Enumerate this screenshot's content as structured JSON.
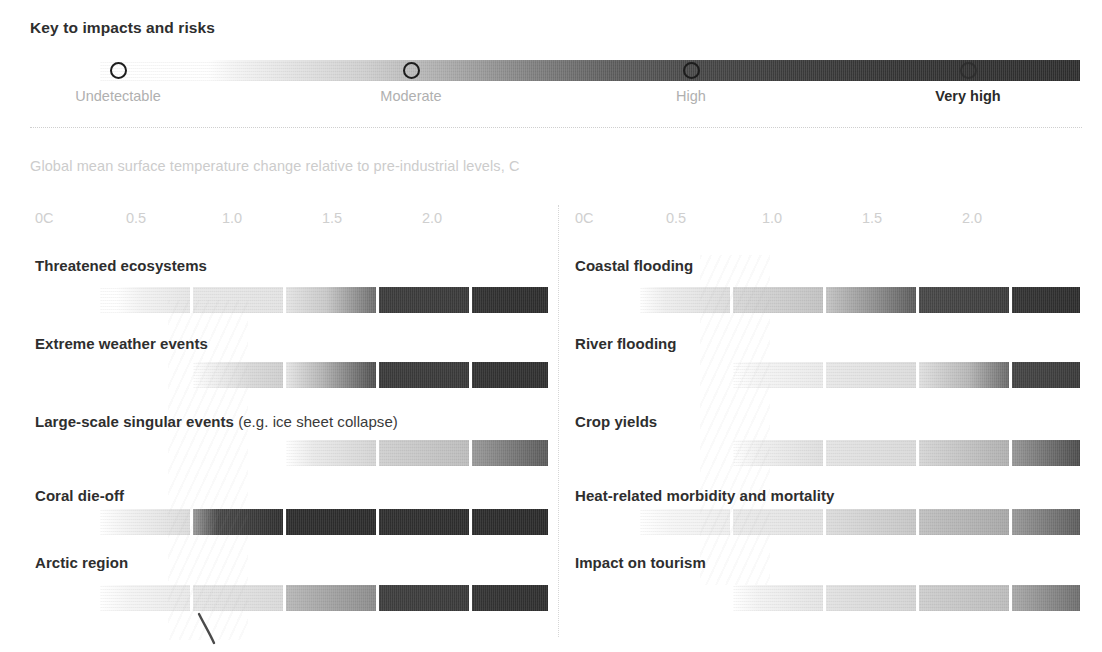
{
  "key": {
    "title": "Key to impacts and risks",
    "levels": [
      {
        "label": "Undetectable",
        "x": 118,
        "emphasis": false
      },
      {
        "label": "Moderate",
        "x": 411,
        "emphasis": false
      },
      {
        "label": "High",
        "x": 691,
        "emphasis": false
      },
      {
        "label": "Very high",
        "x": 968,
        "emphasis": true
      }
    ],
    "gradient_from": "#ffffff",
    "gradient_to": "#2e2e2e"
  },
  "axis": {
    "caption": "Global mean surface temperature change relative to pre-industrial levels, C",
    "ticks": [
      "0C",
      "0.5",
      "1.0",
      "1.5",
      "2.0"
    ],
    "tick_x_left": [
      35,
      126,
      222,
      322,
      422
    ],
    "tick_x_right": [
      575,
      666,
      762,
      862,
      962
    ]
  },
  "chart_data": {
    "type": "heatmap",
    "title": "Key to impacts and risks",
    "xlabel": "Global mean surface temperature change relative to pre-industrial levels, C",
    "ylabel": "",
    "xlim": [
      0,
      2.5
    ],
    "grid": false,
    "legend_position": "top",
    "legend_entries": [
      "Undetectable",
      "Moderate",
      "High",
      "Very high"
    ],
    "categories": [
      "Threatened ecosystems",
      "Extreme weather events",
      "Large-scale singular events (e.g. ice sheet collapse)",
      "Coral die-off",
      "Arctic region",
      "Coastal flooding",
      "River flooding",
      "Crop yields",
      "Heat-related morbidity and mortality",
      "Impact on tourism"
    ],
    "series": [
      {
        "name": "Threatened ecosystems",
        "column": "left",
        "risk_start_C": 0.35,
        "segments": [
          {
            "from": 0.3,
            "to": 0.5,
            "level_start": "undetectable",
            "level_end": "low"
          },
          {
            "from": 0.5,
            "to": 1.0,
            "level_start": "low",
            "level_end": "low"
          },
          {
            "from": 1.0,
            "to": 1.5,
            "level_start": "low",
            "level_end": "high"
          },
          {
            "from": 1.5,
            "to": 2.0,
            "level_start": "high",
            "level_end": "high"
          },
          {
            "from": 2.0,
            "to": 2.5,
            "level_start": "very high",
            "level_end": "very high"
          }
        ]
      },
      {
        "name": "Extreme weather events",
        "column": "left",
        "risk_start_C": 0.65,
        "segments": [
          {
            "from": 0.5,
            "to": 1.0,
            "level_start": "undetectable",
            "level_end": "low"
          },
          {
            "from": 1.0,
            "to": 1.5,
            "level_start": "low",
            "level_end": "high"
          },
          {
            "from": 1.5,
            "to": 2.0,
            "level_start": "high",
            "level_end": "high"
          },
          {
            "from": 2.0,
            "to": 2.5,
            "level_start": "very high",
            "level_end": "very high"
          }
        ]
      },
      {
        "name": "Large-scale singular events (e.g. ice sheet collapse)",
        "column": "left",
        "risk_start_C": 0.95,
        "segments": [
          {
            "from": 0.9,
            "to": 1.0,
            "level_start": "undetectable",
            "level_end": "low"
          },
          {
            "from": 1.0,
            "to": 1.5,
            "level_start": "low",
            "level_end": "low"
          },
          {
            "from": 1.5,
            "to": 2.0,
            "level_start": "low",
            "level_end": "moderate"
          },
          {
            "from": 2.0,
            "to": 2.5,
            "level_start": "moderate",
            "level_end": "high"
          }
        ]
      },
      {
        "name": "Coral die-off",
        "column": "left",
        "risk_start_C": 0.2,
        "segments": [
          {
            "from": 0.1,
            "to": 0.5,
            "level_start": "undetectable",
            "level_end": "low"
          },
          {
            "from": 0.5,
            "to": 1.0,
            "level_start": "moderate",
            "level_end": "very high"
          },
          {
            "from": 1.0,
            "to": 1.5,
            "level_start": "very high",
            "level_end": "very high"
          },
          {
            "from": 1.5,
            "to": 2.0,
            "level_start": "very high",
            "level_end": "very high"
          },
          {
            "from": 2.0,
            "to": 2.5,
            "level_start": "very high",
            "level_end": "very high"
          }
        ]
      },
      {
        "name": "Arctic region",
        "column": "left",
        "risk_start_C": 0.25,
        "segments": [
          {
            "from": 0.15,
            "to": 0.5,
            "level_start": "undetectable",
            "level_end": "low"
          },
          {
            "from": 0.5,
            "to": 1.0,
            "level_start": "low",
            "level_end": "low"
          },
          {
            "from": 1.0,
            "to": 1.5,
            "level_start": "moderate",
            "level_end": "moderate"
          },
          {
            "from": 1.5,
            "to": 2.0,
            "level_start": "high",
            "level_end": "high"
          },
          {
            "from": 2.0,
            "to": 2.5,
            "level_start": "very high",
            "level_end": "very high"
          }
        ]
      },
      {
        "name": "Coastal flooding",
        "column": "right",
        "risk_start_C": 0.15,
        "segments": [
          {
            "from": 0.1,
            "to": 0.5,
            "level_start": "undetectable",
            "level_end": "low"
          },
          {
            "from": 0.5,
            "to": 1.0,
            "level_start": "low",
            "level_end": "moderate"
          },
          {
            "from": 1.0,
            "to": 1.5,
            "level_start": "moderate",
            "level_end": "high"
          },
          {
            "from": 1.5,
            "to": 2.0,
            "level_start": "high",
            "level_end": "high"
          },
          {
            "from": 2.0,
            "to": 2.5,
            "level_start": "very high",
            "level_end": "very high"
          }
        ]
      },
      {
        "name": "River flooding",
        "column": "right",
        "risk_start_C": 0.6,
        "segments": [
          {
            "from": 0.5,
            "to": 1.0,
            "level_start": "undetectable",
            "level_end": "low"
          },
          {
            "from": 1.0,
            "to": 1.5,
            "level_start": "low",
            "level_end": "low"
          },
          {
            "from": 1.5,
            "to": 2.0,
            "level_start": "low",
            "level_end": "moderate"
          },
          {
            "from": 2.0,
            "to": 2.5,
            "level_start": "high",
            "level_end": "high"
          }
        ]
      },
      {
        "name": "Crop yields",
        "column": "right",
        "risk_start_C": 0.6,
        "segments": [
          {
            "from": 0.5,
            "to": 1.0,
            "level_start": "undetectable",
            "level_end": "low"
          },
          {
            "from": 1.0,
            "to": 1.5,
            "level_start": "low",
            "level_end": "low"
          },
          {
            "from": 1.5,
            "to": 2.0,
            "level_start": "low",
            "level_end": "moderate"
          },
          {
            "from": 2.0,
            "to": 2.5,
            "level_start": "moderate",
            "level_end": "high"
          }
        ]
      },
      {
        "name": "Heat-related morbidity and mortality",
        "column": "right",
        "risk_start_C": 0.2,
        "segments": [
          {
            "from": 0.1,
            "to": 0.5,
            "level_start": "undetectable",
            "level_end": "low"
          },
          {
            "from": 0.5,
            "to": 1.0,
            "level_start": "low",
            "level_end": "low"
          },
          {
            "from": 1.0,
            "to": 1.5,
            "level_start": "low",
            "level_end": "moderate"
          },
          {
            "from": 1.5,
            "to": 2.0,
            "level_start": "moderate",
            "level_end": "moderate"
          },
          {
            "from": 2.0,
            "to": 2.5,
            "level_start": "moderate",
            "level_end": "high"
          }
        ]
      },
      {
        "name": "Impact on tourism",
        "column": "right",
        "risk_start_C": 0.95,
        "segments": [
          {
            "from": 0.9,
            "to": 1.0,
            "level_start": "undetectable",
            "level_end": "low"
          },
          {
            "from": 1.0,
            "to": 1.5,
            "level_start": "low",
            "level_end": "low"
          },
          {
            "from": 1.5,
            "to": 2.0,
            "level_start": "low",
            "level_end": "moderate"
          },
          {
            "from": 2.0,
            "to": 2.5,
            "level_start": "moderate",
            "level_end": "high"
          }
        ]
      }
    ]
  },
  "left_rows": [
    {
      "label": "Threatened ecosystems",
      "label_html": "Threatened ecosystems",
      "segments": [
        {
          "x": 100,
          "w": 90,
          "g": "linear-gradient(to right,#ffffff 0%,#ffffff 18%,#f2f2f2 48%,#e6e6e6 100%)"
        },
        {
          "x": 193,
          "w": 90,
          "g": "linear-gradient(to right,#e8e8e8 0%,#e3e3e3 100%)"
        },
        {
          "x": 286,
          "w": 90,
          "g": "linear-gradient(to right,#e4e4e4 0%,#c8c8c8 45%,#6c6c6c 100%)"
        },
        {
          "x": 379,
          "w": 90,
          "g": "linear-gradient(to right,#3c3c3c 0%,#3a3a3a 100%)"
        },
        {
          "x": 472,
          "w": 76,
          "g": "linear-gradient(to right,#323232 0%,#2d2d2d 100%)"
        }
      ]
    },
    {
      "label": "Extreme weather events",
      "label_html": "Extreme weather events",
      "segments": [
        {
          "x": 193,
          "w": 90,
          "g": "linear-gradient(to right,#ffffff 0%,#f0f0f0 22%,#d8d8d8 65%,#cfcfcf 100%)"
        },
        {
          "x": 286,
          "w": 90,
          "g": "linear-gradient(to right,#e6e6e6 0%,#b4b4b4 40%,#4e4e4e 100%)"
        },
        {
          "x": 379,
          "w": 90,
          "g": "linear-gradient(to right,#3a3a3a 0%,#3a3a3a 100%)"
        },
        {
          "x": 472,
          "w": 76,
          "g": "linear-gradient(to right,#333333 0%,#303030 100%)"
        }
      ]
    },
    {
      "label": "Large-scale singular events ",
      "label_html": "Large-scale singular events <span class=\"reg\">(e.g. ice sheet collapse)</span>",
      "segments": [
        {
          "x": 286,
          "w": 90,
          "g": "linear-gradient(to right,#ffffff 0%,#eaeaea 30%,#d4d4d4 100%)"
        },
        {
          "x": 379,
          "w": 90,
          "g": "linear-gradient(to right,#d0d0d0 0%,#bcbcbc 100%)"
        },
        {
          "x": 472,
          "w": 76,
          "g": "linear-gradient(to right,#9a9a9a 0%,#5a5a5a 100%)"
        }
      ]
    },
    {
      "label": "Coral die-off",
      "label_html": "Coral die-off",
      "segments": [
        {
          "x": 100,
          "w": 90,
          "g": "linear-gradient(to right,#ffffff 0%,#f2f2f2 30%,#dcdcdc 100%)"
        },
        {
          "x": 193,
          "w": 90,
          "g": "linear-gradient(to right,#9a9a9a 0%,#484848 28%,#303030 100%)"
        },
        {
          "x": 286,
          "w": 90,
          "g": "linear-gradient(to right,#2e2e2e 0%,#2c2c2c 100%)"
        },
        {
          "x": 379,
          "w": 90,
          "g": "linear-gradient(to right,#303030 0%,#2e2e2e 100%)"
        },
        {
          "x": 472,
          "w": 76,
          "g": "linear-gradient(to right,#2d2d2d 0%,#2b2b2b 100%)"
        }
      ]
    },
    {
      "label": "Arctic region",
      "label_html": "Arctic region",
      "segments": [
        {
          "x": 100,
          "w": 90,
          "g": "linear-gradient(to right,#ffffff 0%,#f4f4f4 35%,#e9e9e9 100%)"
        },
        {
          "x": 193,
          "w": 90,
          "g": "linear-gradient(to right,#e6e6e6 0%,#dadada 100%)"
        },
        {
          "x": 286,
          "w": 90,
          "g": "linear-gradient(to right,#b8b8b8 0%,#8c8c8c 100%)"
        },
        {
          "x": 379,
          "w": 90,
          "g": "linear-gradient(to right,#3e3e3e 0%,#3a3a3a 100%)"
        },
        {
          "x": 472,
          "w": 76,
          "g": "linear-gradient(to right,#343434 0%,#2f2f2f 100%)"
        }
      ]
    }
  ],
  "right_rows": [
    {
      "label": "Coastal flooding",
      "label_html": "Coastal flooding",
      "segments": [
        {
          "x": 640,
          "w": 90,
          "g": "linear-gradient(to right,#ffffff 0%,#eeeeee 28%,#dcdcdc 100%)"
        },
        {
          "x": 733,
          "w": 90,
          "g": "linear-gradient(to right,#d8d8d8 0%,#c2c2c2 100%)"
        },
        {
          "x": 826,
          "w": 90,
          "g": "linear-gradient(to right,#c4c4c4 0%,#8e8e8e 55%,#5a5a5a 100%)"
        },
        {
          "x": 919,
          "w": 90,
          "g": "linear-gradient(to right,#484848 0%,#3c3c3c 100%)"
        },
        {
          "x": 1012,
          "w": 68,
          "g": "linear-gradient(to right,#343434 0%,#2d2d2d 100%)"
        }
      ]
    },
    {
      "label": "River flooding",
      "label_html": "River flooding",
      "segments": [
        {
          "x": 733,
          "w": 90,
          "g": "linear-gradient(to right,#ffffff 0%,#f4f4f4 30%,#eaeaea 100%)"
        },
        {
          "x": 826,
          "w": 90,
          "g": "linear-gradient(to right,#e8e8e8 0%,#dcdcdc 100%)"
        },
        {
          "x": 919,
          "w": 90,
          "g": "linear-gradient(to right,#e0e0e0 0%,#b6b6b6 55%,#6a6a6a 100%)"
        },
        {
          "x": 1012,
          "w": 68,
          "g": "linear-gradient(to right,#454545 0%,#3a3a3a 100%)"
        }
      ]
    },
    {
      "label": "Crop yields",
      "label_html": "Crop yields",
      "segments": [
        {
          "x": 733,
          "w": 90,
          "g": "linear-gradient(to right,#ffffff 0%,#f0f0f0 28%,#dedede 100%)"
        },
        {
          "x": 826,
          "w": 90,
          "g": "linear-gradient(to right,#e4e4e4 0%,#dadada 100%)"
        },
        {
          "x": 919,
          "w": 90,
          "g": "linear-gradient(to right,#d6d6d6 0%,#b0b0b0 100%)"
        },
        {
          "x": 1012,
          "w": 68,
          "g": "linear-gradient(to right,#989898 0%,#4c4c4c 100%)"
        }
      ]
    },
    {
      "label": "Heat-related morbidity and mortality",
      "label_html": "Heat-related morbidity and mortality",
      "segments": [
        {
          "x": 640,
          "w": 90,
          "g": "linear-gradient(to right,#ffffff 0%,#f6f6f6 35%,#eeeeee 100%)"
        },
        {
          "x": 733,
          "w": 90,
          "g": "linear-gradient(to right,#ebebeb 0%,#e2e2e2 100%)"
        },
        {
          "x": 826,
          "w": 90,
          "g": "linear-gradient(to right,#dcdcdc 0%,#c6c6c6 100%)"
        },
        {
          "x": 919,
          "w": 90,
          "g": "linear-gradient(to right,#c0c0c0 0%,#a8a8a8 100%)"
        },
        {
          "x": 1012,
          "w": 68,
          "g": "linear-gradient(to right,#9a9a9a 0%,#5c5c5c 100%)"
        }
      ]
    },
    {
      "label": "Impact on tourism",
      "label_html": "Impact on tourism",
      "segments": [
        {
          "x": 733,
          "w": 90,
          "g": "linear-gradient(to right,#ffffff 0%,#f2f2f2 30%,#e4e4e4 100%)"
        },
        {
          "x": 826,
          "w": 90,
          "g": "linear-gradient(to right,#e2e2e2 0%,#d4d4d4 100%)"
        },
        {
          "x": 919,
          "w": 90,
          "g": "linear-gradient(to right,#cecece 0%,#bcbcbc 100%)"
        },
        {
          "x": 1012,
          "w": 68,
          "g": "linear-gradient(to right,#aaaaaa 0%,#6e6e6e 100%)"
        }
      ]
    }
  ],
  "row_geometry": {
    "label_y": [
      257,
      335,
      413,
      487,
      554
    ],
    "bar_y": [
      287,
      362,
      440,
      509,
      585
    ]
  }
}
